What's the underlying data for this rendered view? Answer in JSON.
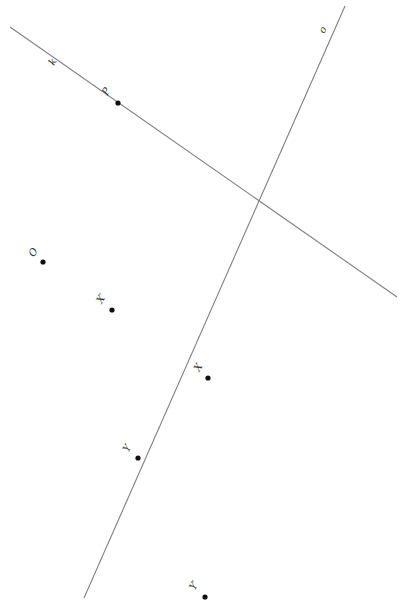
{
  "diagram": {
    "background": "#ffffff",
    "line_color": "#808080",
    "point_color": "#111111",
    "lines": [
      {
        "name": "k",
        "label": "k",
        "x1": 10,
        "y1": 27,
        "x2": 397,
        "y2": 297,
        "label_x": 54,
        "label_y": 66
      },
      {
        "name": "o",
        "label": "o",
        "x1": 345,
        "y1": 6,
        "x2": 84,
        "y2": 598,
        "label_x": 324,
        "label_y": 34
      }
    ],
    "points": [
      {
        "name": "P",
        "label": "P",
        "x": 118,
        "y": 103,
        "label_x": 109,
        "label_y": 93
      },
      {
        "name": "O",
        "label": "O",
        "x": 43,
        "y": 262,
        "label_x": 36,
        "label_y": 254
      },
      {
        "name": "X-prime",
        "label": "X′",
        "x": 112,
        "y": 310,
        "label_x": 104,
        "label_y": 300
      },
      {
        "name": "X",
        "label": "X",
        "x": 208,
        "y": 378,
        "label_x": 201,
        "label_y": 369
      },
      {
        "name": "Y",
        "label": "Y",
        "x": 138,
        "y": 458,
        "label_x": 130,
        "label_y": 450
      },
      {
        "name": "Y-prime",
        "label": "Y′",
        "x": 205,
        "y": 597,
        "label_x": 197,
        "label_y": 587
      }
    ]
  }
}
